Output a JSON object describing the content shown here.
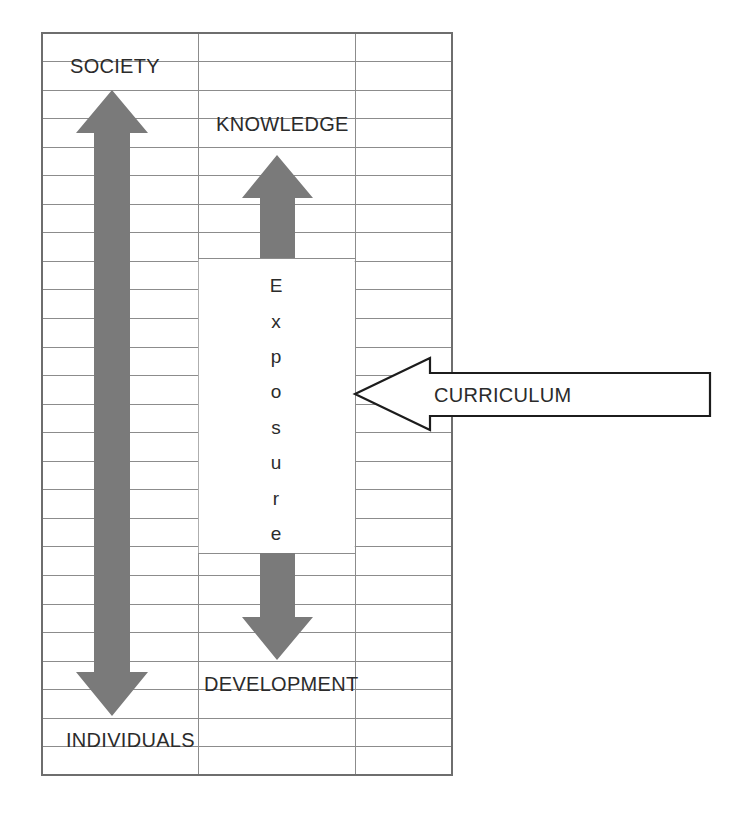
{
  "diagram": {
    "title_labels": {
      "society": "SOCIETY",
      "knowledge": "KNOWLEDGE",
      "development": "DEVELOPMENT",
      "individuals": "INDIVIDUALS",
      "curriculum": "CURRICULUM"
    },
    "exposure_label": "Exposure",
    "exposure_letters": [
      "E",
      "x",
      "p",
      "o",
      "s",
      "u",
      "r",
      "e"
    ],
    "colors": {
      "arrow_gray": "#7a7a7a",
      "grid_line": "#8c8c8c",
      "outer_border": "#6e6e6e",
      "text": "#2b2b2b",
      "arrow_outline_stroke": "#1c1c1c",
      "background": "#ffffff"
    },
    "grid": {
      "left": 42,
      "right": 452,
      "top": 33,
      "bottom": 775,
      "column_dividers": [
        198,
        355
      ],
      "row_count": 26,
      "row_height": 28.5
    },
    "arrows": [
      {
        "name": "society-arrow",
        "direction": "up-and-down",
        "style": "solid-gray",
        "from": "INDIVIDUALS",
        "to": "SOCIETY"
      },
      {
        "name": "knowledge-arrow",
        "direction": "up",
        "style": "solid-gray",
        "to": "KNOWLEDGE"
      },
      {
        "name": "development-arrow",
        "direction": "down",
        "style": "solid-gray",
        "to": "DEVELOPMENT"
      },
      {
        "name": "curriculum-arrow",
        "direction": "left",
        "style": "outlined-white",
        "label": "CURRICULUM"
      }
    ]
  }
}
